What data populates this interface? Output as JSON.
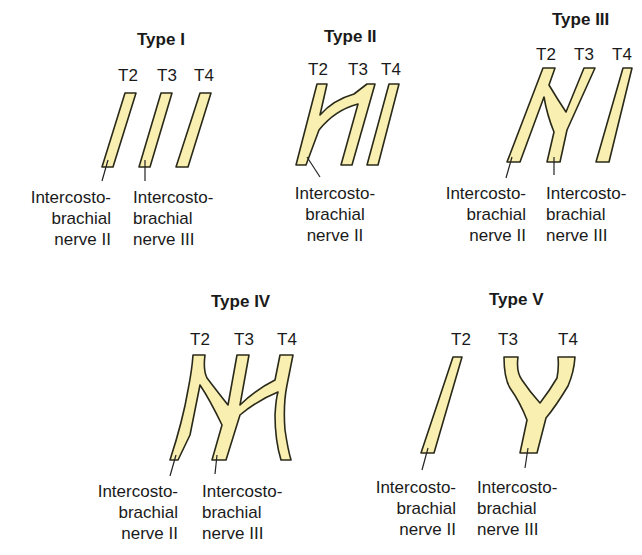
{
  "colors": {
    "nerve_fill": "#f9efb0",
    "nerve_outline": "#2a2a1a",
    "text": "#1a1a1a"
  },
  "segments": [
    "T2",
    "T3",
    "T4"
  ],
  "types": [
    {
      "title": "Type I",
      "segment_labels": [
        "T2",
        "T3",
        "T4"
      ],
      "captions": [
        [
          "Intercosto-",
          "brachial",
          "nerve II"
        ],
        [
          "Intercosto-",
          "brachial",
          "nerve III"
        ]
      ]
    },
    {
      "title": "Type II",
      "segment_labels": [
        "T2",
        "T3",
        "T4"
      ],
      "captions": [
        [
          "Intercosto-",
          "brachial",
          "nerve II"
        ]
      ]
    },
    {
      "title": "Type III",
      "segment_labels": [
        "T2",
        "T3",
        "T4"
      ],
      "captions": [
        [
          "Intercosto-",
          "brachial",
          "nerve II"
        ],
        [
          "Intercosto-",
          "brachial",
          "nerve III"
        ]
      ]
    },
    {
      "title": "Type IV",
      "segment_labels": [
        "T2",
        "T3",
        "T4"
      ],
      "captions": [
        [
          "Intercosto-",
          "brachial",
          "nerve II"
        ],
        [
          "Intercosto-",
          "brachial",
          "nerve III"
        ]
      ]
    },
    {
      "title": "Type V",
      "segment_labels": [
        "T2",
        "T3",
        "T4"
      ],
      "captions": [
        [
          "Intercosto-",
          "brachial",
          "nerve II"
        ],
        [
          "Intercosto-",
          "brachial",
          "nerve III"
        ]
      ]
    }
  ]
}
